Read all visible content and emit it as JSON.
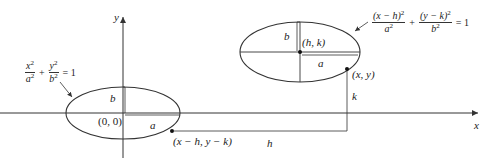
{
  "diagram": {
    "axes": {
      "x_label": "x",
      "y_label": "y"
    },
    "left_ellipse": {
      "equation": {
        "term1_num": "x",
        "term1_den": "a",
        "term2_num": "y",
        "term2_den": "b",
        "exp": "2",
        "plus": "+",
        "rhs": "= 1"
      },
      "center_label": "(0, 0)",
      "semi_major_label": "a",
      "semi_minor_label": "b",
      "point_label": "(x − h, y − k)"
    },
    "right_ellipse": {
      "equation": {
        "term1_num": "(x − h)",
        "term1_den": "a",
        "term2_num": "(y − k)",
        "term2_den": "b",
        "exp": "2",
        "plus": "+",
        "rhs": "= 1"
      },
      "center_label": "(h, k)",
      "semi_major_label": "a",
      "semi_minor_label": "b",
      "point_label": "(x, y)"
    },
    "shift_labels": {
      "h": "h",
      "k": "k"
    },
    "colors": {
      "stroke": "#333333",
      "background": "#ffffff"
    }
  }
}
